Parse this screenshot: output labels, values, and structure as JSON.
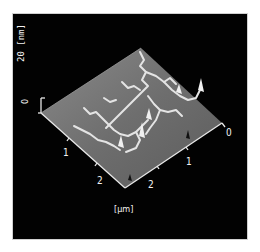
{
  "figure": {
    "type": "AFM 3D topography",
    "z_axis": {
      "label": "[nm]",
      "ticks": [
        "0",
        "20"
      ]
    },
    "xy_axis": {
      "unit_label": "[µm]",
      "left_ticks": [
        "1",
        "2"
      ],
      "right_ticks": [
        "0",
        "1",
        "2"
      ]
    }
  },
  "colors": {
    "background": "#020202",
    "surface": "#7a7a7a",
    "ridges": "#e6e6e6",
    "text": "#f2f2f2"
  }
}
